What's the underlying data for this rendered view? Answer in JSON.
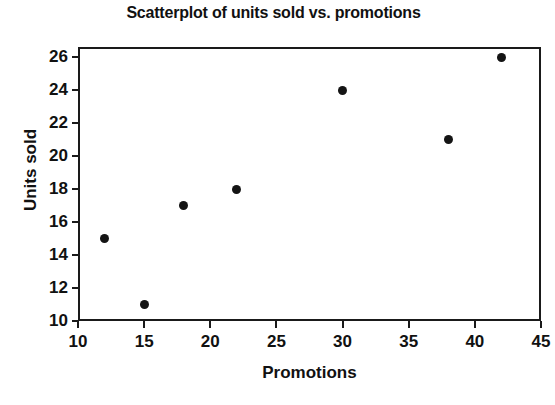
{
  "chart_data": {
    "type": "scatter",
    "title": "Scatterplot of units sold vs. promotions",
    "xlabel": "Promotions",
    "ylabel": "Units sold",
    "xlim": [
      10,
      45
    ],
    "ylim": [
      10,
      27
    ],
    "grid": false,
    "legend": null,
    "marker_color": "#141414",
    "axis_color": "#1a1a1a",
    "background_color": "#ffffff",
    "xticks": [
      10,
      15,
      20,
      25,
      30,
      35,
      40,
      45
    ],
    "yticks": [
      10,
      12,
      14,
      16,
      18,
      20,
      22,
      24,
      26
    ],
    "x": [
      12,
      15,
      18,
      22,
      30,
      38,
      42
    ],
    "y": [
      15,
      11,
      17,
      18,
      24,
      21,
      26
    ],
    "points": [
      {
        "x": 12,
        "y": 15
      },
      {
        "x": 15,
        "y": 11
      },
      {
        "x": 18,
        "y": 17
      },
      {
        "x": 22,
        "y": 18
      },
      {
        "x": 30,
        "y": 24
      },
      {
        "x": 38,
        "y": 21
      },
      {
        "x": 42,
        "y": 26
      }
    ]
  }
}
